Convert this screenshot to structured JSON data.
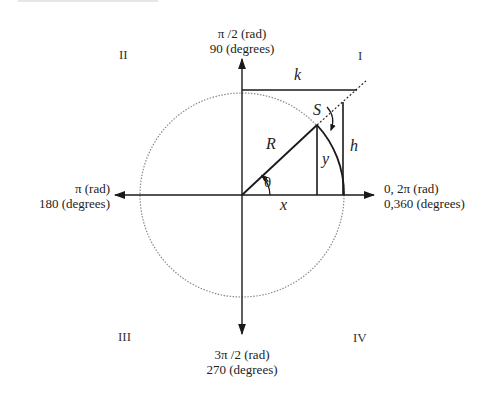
{
  "axes": {
    "top": {
      "line1": "π /2 (rad)",
      "line2": "90 (degrees)"
    },
    "left": {
      "line1": "π (rad)",
      "line2": "180 (degrees)"
    },
    "right": {
      "line1": "0, 2π (rad)",
      "line2": "0,360 (degrees)"
    },
    "bottom": {
      "line1": "3π /2 (rad)",
      "line2": "270 (degrees)"
    }
  },
  "quadrants": {
    "q1": "I",
    "q2": "II",
    "q3": "III",
    "q4": "IV"
  },
  "variables": {
    "k": "k",
    "s": "S",
    "r": "R",
    "y": "y",
    "h": "h",
    "x": "x",
    "theta": "θ"
  },
  "colors": {
    "line": "#1a1a1a",
    "circle": "#8a8a8a",
    "background": "#ffffff"
  }
}
